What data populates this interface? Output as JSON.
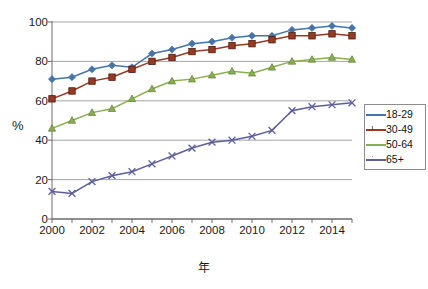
{
  "chart_data": {
    "type": "line",
    "title": "",
    "xlabel": "年",
    "ylabel": "%",
    "xlim": [
      2000,
      2015
    ],
    "ylim": [
      0,
      100
    ],
    "grid": true,
    "grid_axis": "y",
    "legend_position": "right",
    "x": [
      2000,
      2001,
      2002,
      2003,
      2004,
      2005,
      2006,
      2007,
      2008,
      2009,
      2010,
      2011,
      2012,
      2013,
      2014,
      2015
    ],
    "xticklabels": [
      "2000",
      "",
      "2002",
      "",
      "2004",
      "",
      "2006",
      "",
      "2008",
      "",
      "2010",
      "",
      "2012",
      "",
      "2014",
      ""
    ],
    "yticks": [
      0,
      20,
      40,
      60,
      80,
      100
    ],
    "series": [
      {
        "name": "18-29",
        "color": "#4574a8",
        "marker": "diamond",
        "values": [
          71,
          72,
          76,
          78,
          77,
          84,
          86,
          89,
          90,
          92,
          93,
          93,
          96,
          97,
          98,
          97
        ]
      },
      {
        "name": "30-49",
        "color": "#983a23",
        "marker": "square",
        "values": [
          61,
          65,
          70,
          72,
          76,
          80,
          82,
          85,
          86,
          88,
          89,
          91,
          93,
          93,
          94,
          93
        ]
      },
      {
        "name": "50-64",
        "color": "#88b04f",
        "marker": "triangle",
        "values": [
          46,
          50,
          54,
          56,
          61,
          66,
          70,
          71,
          73,
          75,
          74,
          77,
          80,
          81,
          82,
          81
        ]
      },
      {
        "name": "65+",
        "color": "#5c5f9c",
        "marker": "cross",
        "values": [
          14,
          13,
          19,
          22,
          24,
          28,
          32,
          36,
          39,
          40,
          42,
          45,
          55,
          57,
          58,
          59
        ]
      }
    ]
  },
  "legend": {
    "items": [
      {
        "label": "18-29"
      },
      {
        "label": "30-49"
      },
      {
        "label": "50-64"
      },
      {
        "label": "65+"
      }
    ]
  },
  "axes": {
    "y_axis_title": "%",
    "x_axis_title": "年"
  }
}
